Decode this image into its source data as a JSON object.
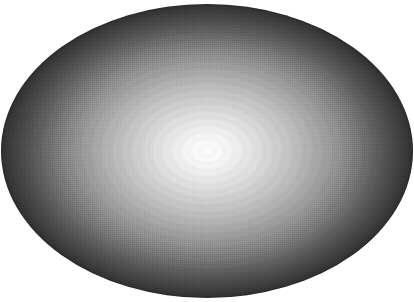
{
  "image": {
    "title": "Radial gradient ellipse",
    "subject": "sphere-sheen-ellipse",
    "background_color": "#ffffff",
    "canvas": {
      "width": 414,
      "height": 302
    }
  },
  "shape": {
    "type": "ellipse",
    "center_x": 207,
    "center_y": 151,
    "radius_x": 206,
    "radius_y": 147,
    "left": 1,
    "top": 4,
    "width": 412,
    "height": 294,
    "highlight_center_x": 207,
    "highlight_center_y": 152,
    "rim_color": "#2e2e2e",
    "core_color": "#fbfbfb"
  },
  "gradient": {
    "type": "radial",
    "shape": "ellipse",
    "center": "50% 50%",
    "extent_x": 206,
    "extent_y": 147,
    "stops": [
      {
        "color": "#fcfcfc",
        "position": "0%"
      },
      {
        "color": "#fafafa",
        "position": "6%"
      },
      {
        "color": "#f4f4f4",
        "position": "11%"
      },
      {
        "color": "#ededed",
        "position": "16%"
      },
      {
        "color": "#e5e5e5",
        "position": "21%"
      },
      {
        "color": "#dddddd",
        "position": "26%"
      },
      {
        "color": "#d4d4d4",
        "position": "31%"
      },
      {
        "color": "#cbcbcb",
        "position": "36%"
      },
      {
        "color": "#c2c2c2",
        "position": "41%"
      },
      {
        "color": "#b8b8b8",
        "position": "46%"
      },
      {
        "color": "#aeaeae",
        "position": "51%"
      },
      {
        "color": "#a3a3a3",
        "position": "56%"
      },
      {
        "color": "#989898",
        "position": "61%"
      },
      {
        "color": "#8c8c8c",
        "position": "66%"
      },
      {
        "color": "#7f7f7f",
        "position": "71%"
      },
      {
        "color": "#717171",
        "position": "76%"
      },
      {
        "color": "#626262",
        "position": "81%"
      },
      {
        "color": "#545454",
        "position": "86%"
      },
      {
        "color": "#474747",
        "position": "91%"
      },
      {
        "color": "#3b3b3b",
        "position": "96%"
      },
      {
        "color": "#2e2e2e",
        "position": "100%"
      }
    ]
  },
  "texture": {
    "dither": "checkerboard-dither",
    "banding": "concentric-contour-bands"
  }
}
